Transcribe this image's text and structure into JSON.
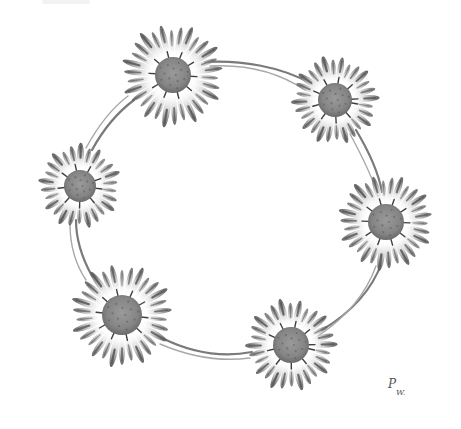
{
  "artwork": {
    "subject": "daisy chain wreath",
    "background": "#ffffff",
    "ink_color": "#6e6e6e",
    "center_color": "#8a8a8a",
    "petal_tip_color": "#5a5a5a",
    "signature": {
      "first": "P",
      "second": "W."
    }
  },
  "flowers": [
    {
      "name": "daisy-top-left",
      "cx": 173,
      "cy": 75,
      "r": 50,
      "core": 18,
      "petals": 30,
      "rotation": 4
    },
    {
      "name": "daisy-top-right",
      "cx": 335,
      "cy": 100,
      "r": 42,
      "core": 17,
      "petals": 28,
      "rotation": 10
    },
    {
      "name": "daisy-right",
      "cx": 386,
      "cy": 222,
      "r": 46,
      "core": 18,
      "petals": 30,
      "rotation": 2
    },
    {
      "name": "daisy-left",
      "cx": 80,
      "cy": 186,
      "r": 40,
      "core": 16,
      "petals": 26,
      "rotation": 8
    },
    {
      "name": "daisy-bottom-left",
      "cx": 122,
      "cy": 315,
      "r": 50,
      "core": 20,
      "petals": 30,
      "rotation": 6
    },
    {
      "name": "daisy-bottom-right",
      "cx": 291,
      "cy": 345,
      "r": 44,
      "core": 18,
      "petals": 28,
      "rotation": 12
    }
  ],
  "stems": [
    {
      "name": "stem-top-to-top-right",
      "d": "M205,62 C240,60 280,66 312,84"
    },
    {
      "name": "stem-top-to-top-right-b",
      "d": "M210,66 C245,64 278,72 305,90"
    },
    {
      "name": "stem-top-right-to-right",
      "d": "M356,130 C368,150 378,170 382,192"
    },
    {
      "name": "stem-top-right-to-right-b",
      "d": "M350,134 C362,156 372,176 378,196"
    },
    {
      "name": "stem-right-to-bottom-right",
      "d": "M382,262 C372,290 352,312 322,330"
    },
    {
      "name": "stem-right-to-bottom-right-b",
      "d": "M376,266 C366,294 348,316 318,336"
    },
    {
      "name": "stem-bottom-right-to-bottom-left",
      "d": "M252,352 C220,358 190,352 162,338"
    },
    {
      "name": "stem-bottom-right-to-bottom-left-b",
      "d": "M250,358 C220,362 188,356 160,344"
    },
    {
      "name": "stem-bottom-left-to-left",
      "d": "M92,276 C82,258 76,238 76,220"
    },
    {
      "name": "stem-bottom-left-to-left-b",
      "d": "M86,280 C74,262 70,242 70,224"
    },
    {
      "name": "stem-left-to-top-left",
      "d": "M92,150 C104,128 118,112 134,100"
    },
    {
      "name": "stem-left-to-top-left-b",
      "d": "M86,148 C98,126 112,108 128,96"
    }
  ]
}
